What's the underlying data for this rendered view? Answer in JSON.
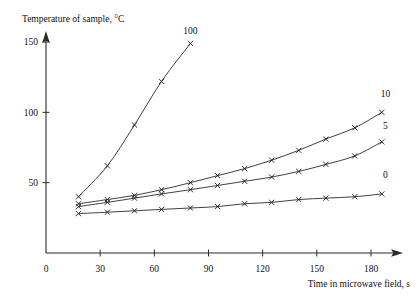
{
  "chart_data": {
    "type": "line",
    "title": "",
    "xlabel": "Time in microwave field, s",
    "ylabel": "Temperature of sample, °C",
    "xlim": [
      0,
      195
    ],
    "ylim": [
      0,
      158
    ],
    "xticks": [
      0,
      30,
      60,
      90,
      120,
      150,
      180
    ],
    "xtick_labels": [
      "0",
      "30",
      "60",
      "90",
      "120",
      "150",
      "180"
    ],
    "yticks": [
      50,
      100,
      150
    ],
    "ytick_labels": [
      "50",
      "100",
      "150"
    ],
    "grid": false,
    "legend_position": "line-end-labels",
    "marker": "x",
    "series": [
      {
        "name": "100",
        "label": "100",
        "label_x": 80,
        "label_y": 156,
        "x": [
          18,
          34,
          49,
          64,
          80
        ],
        "y": [
          40,
          62,
          91,
          122,
          149
        ]
      },
      {
        "name": "10",
        "label": "10",
        "label_x": 188,
        "label_y": 111,
        "x": [
          18,
          34,
          49,
          64,
          80,
          95,
          110,
          125,
          140,
          155,
          171,
          186
        ],
        "y": [
          35,
          38,
          41,
          45,
          50,
          55,
          60,
          66,
          73,
          81,
          89,
          100
        ]
      },
      {
        "name": "5",
        "label": "5",
        "label_x": 188,
        "label_y": 88,
        "x": [
          18,
          34,
          49,
          64,
          80,
          95,
          110,
          125,
          140,
          155,
          171,
          186
        ],
        "y": [
          33,
          36,
          39,
          42,
          45,
          48,
          51,
          54,
          58,
          63,
          69,
          79
        ]
      },
      {
        "name": "0",
        "label": "0",
        "label_x": 188,
        "label_y": 53,
        "x": [
          18,
          34,
          49,
          64,
          80,
          95,
          110,
          125,
          140,
          155,
          171,
          186
        ],
        "y": [
          28,
          29,
          30,
          31,
          32,
          33,
          35,
          36,
          38,
          39,
          40,
          42
        ]
      }
    ]
  },
  "axes": {
    "y_axis_name": "temperature-axis",
    "x_axis_name": "time-axis"
  }
}
